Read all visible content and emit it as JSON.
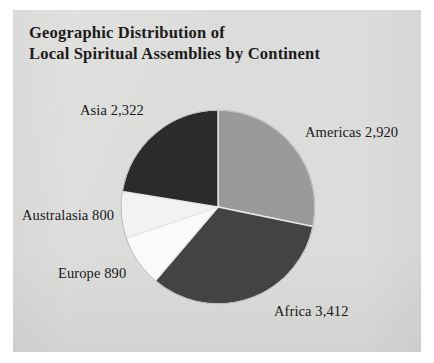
{
  "figure": {
    "background_color": "#ffffff",
    "card_color": "#dcdcda",
    "title_line1": "Geographic Distribution of",
    "title_line2": "Local Spiritual Assemblies by Continent"
  },
  "chart_data": {
    "type": "pie",
    "title": "Geographic Distribution of Local Spiritual Assemblies by Continent",
    "xlabel": "",
    "ylabel": "",
    "legend_position": "none",
    "grid": false,
    "start_angle_deg": 90,
    "direction": "clockwise",
    "total": 10344,
    "categories": [
      "Americas",
      "Africa",
      "Europe",
      "Australasia",
      "Asia"
    ],
    "values": [
      2920,
      3412,
      890,
      800,
      2322
    ],
    "labels": [
      "Americas 2,920",
      "Africa 3,412",
      "Europe 890",
      "Australasia 800",
      "Asia 2,322"
    ],
    "colors": [
      "#9a9a9a",
      "#434343",
      "#fafafa",
      "#f2f2f2",
      "#2b2b2b"
    ],
    "slices": [
      {
        "name": "Americas",
        "value": 2920,
        "label": "Americas 2,920",
        "color": "#9a9a9a",
        "percent": 28.2
      },
      {
        "name": "Africa",
        "value": 3412,
        "label": "Africa 3,412",
        "color": "#434343",
        "percent": 33.0
      },
      {
        "name": "Europe",
        "value": 890,
        "label": "Europe 890",
        "color": "#fafafa",
        "percent": 8.6
      },
      {
        "name": "Australasia",
        "value": 800,
        "label": "Australasia 800",
        "color": "#f2f2f2",
        "percent": 7.7
      },
      {
        "name": "Asia",
        "value": 2322,
        "label": "Asia 2,322",
        "color": "#2b2b2b",
        "percent": 22.4
      }
    ]
  }
}
